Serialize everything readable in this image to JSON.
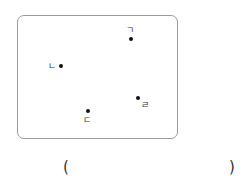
{
  "diagram": {
    "points": [
      {
        "label": "ㄱ"
      },
      {
        "label": "ㄴ"
      },
      {
        "label": "ㄷ"
      },
      {
        "label": "ㄹ"
      }
    ]
  },
  "answer": {
    "open": "(",
    "close": ")"
  }
}
